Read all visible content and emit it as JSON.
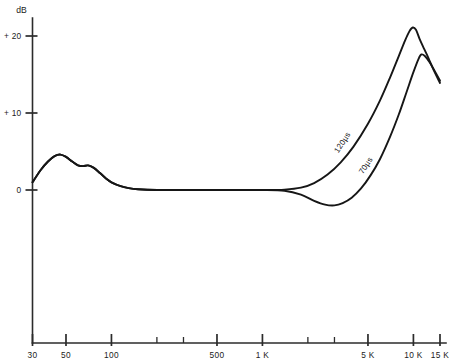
{
  "chart_data": {
    "type": "line",
    "title": "",
    "subtitle": "",
    "xlabel": "",
    "ylabel": "dB",
    "y_unit_label": "dB",
    "xscale": "log",
    "yscale": "linear",
    "xlim": [
      30,
      15000
    ],
    "ylim": [
      -6,
      24
    ],
    "grid": false,
    "legend": "inline-curve-labels",
    "x_ticks": [
      {
        "value": 30,
        "label": "30",
        "major": true
      },
      {
        "value": 50,
        "label": "50",
        "major": true
      },
      {
        "value": 100,
        "label": "100",
        "major": true
      },
      {
        "value": 200,
        "label": "",
        "major": false
      },
      {
        "value": 300,
        "label": "",
        "major": false
      },
      {
        "value": 500,
        "label": "500",
        "major": true
      },
      {
        "value": 1000,
        "label": "1 K",
        "major": true
      },
      {
        "value": 2000,
        "label": "",
        "major": false
      },
      {
        "value": 3000,
        "label": "",
        "major": false
      },
      {
        "value": 5000,
        "label": "5 K",
        "major": true
      },
      {
        "value": 10000,
        "label": "10 K",
        "major": true
      },
      {
        "value": 15000,
        "label": "15 K",
        "major": true
      }
    ],
    "y_ticks": [
      {
        "value": 20,
        "label": "+ 20"
      },
      {
        "value": 10,
        "label": "+ 10"
      },
      {
        "value": 0,
        "label": "0"
      }
    ],
    "series": [
      {
        "name": "120µs",
        "label": "120µs",
        "color": "#161616",
        "points": [
          [
            30,
            1.0
          ],
          [
            34,
            2.6
          ],
          [
            38,
            3.7
          ],
          [
            42,
            4.4
          ],
          [
            46,
            4.6
          ],
          [
            50,
            4.3
          ],
          [
            55,
            3.7
          ],
          [
            60,
            3.2
          ],
          [
            65,
            3.1
          ],
          [
            70,
            3.2
          ],
          [
            76,
            2.9
          ],
          [
            84,
            2.2
          ],
          [
            92,
            1.5
          ],
          [
            100,
            1.0
          ],
          [
            115,
            0.5
          ],
          [
            130,
            0.25
          ],
          [
            150,
            0.1
          ],
          [
            200,
            0.0
          ],
          [
            300,
            0.0
          ],
          [
            500,
            0.0
          ],
          [
            800,
            0.0
          ],
          [
            1000,
            0.0
          ],
          [
            1400,
            0.05
          ],
          [
            1800,
            0.3
          ],
          [
            2200,
            0.9
          ],
          [
            2700,
            2.0
          ],
          [
            3300,
            3.6
          ],
          [
            4000,
            5.6
          ],
          [
            5000,
            8.6
          ],
          [
            6000,
            11.6
          ],
          [
            7000,
            14.6
          ],
          [
            8000,
            17.4
          ],
          [
            8800,
            19.4
          ],
          [
            9400,
            20.6
          ],
          [
            9900,
            21.1
          ],
          [
            10400,
            20.8
          ],
          [
            11000,
            19.6
          ],
          [
            11800,
            18.3
          ],
          [
            12600,
            17.1
          ],
          [
            13600,
            15.6
          ],
          [
            15000,
            13.9
          ]
        ]
      },
      {
        "name": "70µs",
        "label": "70µs",
        "color": "#161616",
        "points": [
          [
            30,
            1.0
          ],
          [
            34,
            2.6
          ],
          [
            38,
            3.7
          ],
          [
            42,
            4.4
          ],
          [
            46,
            4.6
          ],
          [
            50,
            4.3
          ],
          [
            55,
            3.7
          ],
          [
            60,
            3.2
          ],
          [
            65,
            3.1
          ],
          [
            70,
            3.2
          ],
          [
            76,
            2.9
          ],
          [
            84,
            2.2
          ],
          [
            92,
            1.5
          ],
          [
            100,
            1.0
          ],
          [
            115,
            0.5
          ],
          [
            130,
            0.25
          ],
          [
            150,
            0.1
          ],
          [
            200,
            0.0
          ],
          [
            300,
            0.0
          ],
          [
            500,
            0.0
          ],
          [
            800,
            0.0
          ],
          [
            1000,
            0.0
          ],
          [
            1400,
            -0.1
          ],
          [
            1800,
            -0.6
          ],
          [
            2200,
            -1.4
          ],
          [
            2600,
            -1.9
          ],
          [
            3000,
            -2.0
          ],
          [
            3400,
            -1.7
          ],
          [
            3900,
            -1.0
          ],
          [
            4500,
            0.2
          ],
          [
            5200,
            1.9
          ],
          [
            6000,
            4.0
          ],
          [
            7000,
            6.9
          ],
          [
            8000,
            9.8
          ],
          [
            9000,
            12.7
          ],
          [
            10000,
            15.3
          ],
          [
            10800,
            17.0
          ],
          [
            11300,
            17.6
          ],
          [
            11900,
            17.4
          ],
          [
            12800,
            16.6
          ],
          [
            13800,
            15.5
          ],
          [
            15000,
            14.2
          ]
        ]
      }
    ],
    "annotations": [
      {
        "text": "120µs",
        "x_value": 3500,
        "y_value": 6.0,
        "rotation": -57
      },
      {
        "text": "70µs",
        "x_value": 5000,
        "y_value": 3.0,
        "rotation": -57
      }
    ]
  }
}
